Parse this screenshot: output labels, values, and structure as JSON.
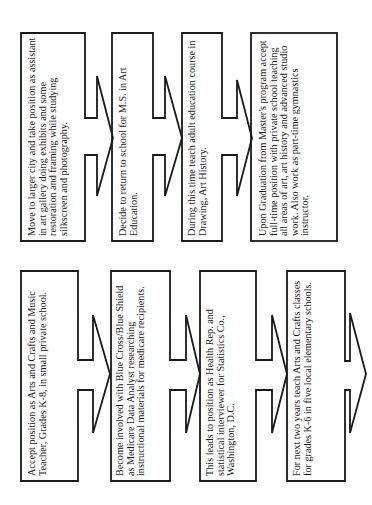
{
  "flowchart": {
    "orientation": "rotated-90-ccw",
    "line_color": "#1a1a1a",
    "top_row": {
      "steps": [
        {
          "text": "Move to larger city and take position as assistant in art gallery doing exhibits and some restoration and framing while studying silkscreen and photography."
        },
        {
          "text": "Decide to return to school for M.S. in Art Education."
        },
        {
          "text": "During this time teach adult education course in Drawing, Art History."
        },
        {
          "text": "Upon Graduation from Master's program accept full-time position with private school teaching all areas of art, art history and advanced studio work. Also work as part-time gymnastics instructor."
        }
      ]
    },
    "bottom_row": {
      "steps": [
        {
          "text": "Accept position as Arts and Crafts and Music Teacher, Grades K-8, in small private school."
        },
        {
          "text": "Become involved with Blue Cross/Blue Shield as Medicare Data Analyst researching instructional materials for medicare recipients."
        },
        {
          "text": "This leads to position as Health Rep. and statistical interviewer for Statistics Co., Washington, D.C."
        },
        {
          "text": "For next two years teach Arts and Crafts classes for grades K-6 in five local elementary schools."
        }
      ]
    }
  }
}
